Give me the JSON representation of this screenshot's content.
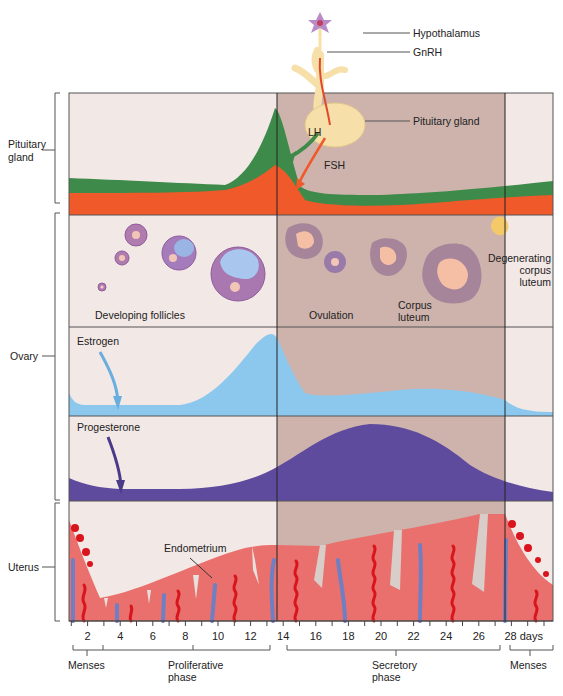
{
  "colors": {
    "proliferative_bg": "#f2e8e6",
    "secretory_bg": "#cdb3ac",
    "lh_green": "#3e8a4a",
    "fsh_orange": "#f0592a",
    "estrogen_blue": "#8cc8ee",
    "progesterone_purple": "#5e4b9e",
    "endometrium": "#e9706c",
    "artery_red": "#d8141c",
    "vein_blue": "#6f7fc4",
    "gland_tan": "#f6dfa8"
  },
  "side_labels": {
    "pituitary": "Pituitary\ngland",
    "pituitary_line1": "Pituitary",
    "pituitary_line2": "gland",
    "ovary": "Ovary",
    "uterus": "Uterus"
  },
  "top_labels": {
    "hypothalamus": "Hypothalamus",
    "gnrh": "GnRH",
    "pituitary_gland": "Pituitary gland",
    "lh": "LH",
    "fsh": "FSH"
  },
  "ovary_panel": {
    "developing_follicles": "Developing follicles",
    "ovulation": "Ovulation",
    "corpus_luteum_1": "Corpus",
    "corpus_luteum_2": "luteum",
    "degenerating_1": "Degenerating",
    "degenerating_2": "corpus",
    "degenerating_3": "luteum"
  },
  "hormone_labels": {
    "estrogen": "Estrogen",
    "progesterone": "Progesterone"
  },
  "uterus_panel": {
    "endometrium": "Endometrium"
  },
  "x_axis": {
    "ticks": [
      "2",
      "4",
      "6",
      "8",
      "10",
      "12",
      "14",
      "16",
      "18",
      "20",
      "22",
      "24",
      "26",
      "28 days"
    ],
    "unit": "days"
  },
  "phases": {
    "menses_1": "Menses",
    "proliferative_1": "Proliferative",
    "proliferative_2": "phase",
    "secretory_1": "Secretory",
    "secretory_2": "phase",
    "menses_2": "Menses"
  },
  "chart_data": {
    "type": "area",
    "xlabel": "days",
    "x": [
      1,
      2,
      4,
      6,
      8,
      10,
      11,
      12,
      13,
      14,
      15,
      16,
      18,
      20,
      22,
      24,
      26,
      28,
      29
    ],
    "series": [
      {
        "name": "LH",
        "values": [
          2,
          2,
          2,
          1.9,
          1.8,
          1.7,
          2,
          3.5,
          7,
          10,
          5,
          1.5,
          1.3,
          1.3,
          1.4,
          1.6,
          1.8,
          2,
          2
        ]
      },
      {
        "name": "FSH",
        "values": [
          1.3,
          1.3,
          1.3,
          1.3,
          1.4,
          1.6,
          1.9,
          2.5,
          3.2,
          3.7,
          2.4,
          1,
          0.8,
          0.8,
          0.9,
          1.1,
          1.3,
          1.4,
          1.4
        ]
      },
      {
        "name": "Estrogen",
        "values": [
          2,
          0.8,
          0.8,
          0.8,
          1.2,
          2.8,
          4.5,
          6.5,
          8.3,
          9.3,
          6,
          1.8,
          2,
          2.6,
          2.8,
          2.7,
          2.4,
          1.4,
          1.1
        ]
      },
      {
        "name": "Progesterone",
        "values": [
          2,
          1,
          1,
          1,
          1.3,
          1.9,
          2.4,
          3,
          3.7,
          4.5,
          5.5,
          6.8,
          8.7,
          9.2,
          8.8,
          6.4,
          3.8,
          2.3,
          1.5
        ]
      }
    ],
    "annotations": [
      "Ovulation at day 14",
      "Secretory phase days 14–28"
    ],
    "phase_bands": [
      {
        "name": "Proliferative",
        "from": 1,
        "to": 14
      },
      {
        "name": "Secretory",
        "from": 14,
        "to": 28
      },
      {
        "name": "Menses",
        "from": 28,
        "to": 29
      }
    ]
  }
}
